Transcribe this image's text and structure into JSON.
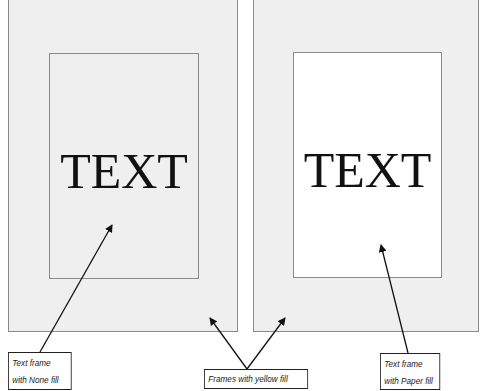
{
  "diagram": {
    "left_panel": {
      "outer_frame": {
        "fill": "yellow",
        "display_color": "#efefef"
      },
      "inner_frame": {
        "fill": "None",
        "text": "TEXT"
      }
    },
    "right_panel": {
      "outer_frame": {
        "fill": "yellow",
        "display_color": "#efefef"
      },
      "inner_frame": {
        "fill": "Paper",
        "display_color": "#ffffff",
        "text": "TEXT"
      }
    },
    "callouts": [
      {
        "id": "none-fill",
        "line1": "Text frame",
        "line2": "with None fill"
      },
      {
        "id": "yellow-fill",
        "line1": "Frames with yellow fill"
      },
      {
        "id": "paper-fill",
        "line1": "Text frame",
        "line2": "with Paper fill"
      }
    ]
  }
}
